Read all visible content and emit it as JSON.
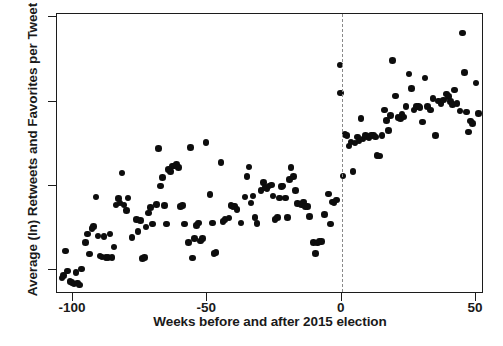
{
  "chart_data": {
    "type": "scatter",
    "title": "",
    "xlabel": "Weeks before and after 2015 election",
    "ylabel": "Average (ln) Retweets and Favorites per Tweet",
    "xlim": [
      -106,
      53
    ],
    "ylim": [
      0.36,
      2.02
    ],
    "xticks": [
      -100,
      -50,
      0,
      50
    ],
    "xtick_labels": [
      "-100",
      "-50",
      "0",
      "50"
    ],
    "yticks": [
      0.5,
      1.0,
      1.5,
      2.0
    ],
    "ytick_labels": [
      ".5",
      "1",
      "1.5",
      "2"
    ],
    "grid": false,
    "legend": null,
    "marker_color": "#0d0d0d",
    "marker_size_px": 6.6,
    "frame_color": "#1c1c1c",
    "annotations": [
      {
        "type": "vline",
        "x": 0,
        "style": "dashed",
        "color": "#8a8a8a",
        "label": "2015 election"
      }
    ],
    "points": [
      [
        -104.2,
        0.455
      ],
      [
        -103.6,
        0.468
      ],
      [
        -102.8,
        0.615
      ],
      [
        -102.0,
        0.497
      ],
      [
        -101.2,
        0.435
      ],
      [
        -100.4,
        0.428
      ],
      [
        -99.6,
        0.419
      ],
      [
        -99.0,
        0.487
      ],
      [
        -98.3,
        0.425
      ],
      [
        -97.6,
        0.413
      ],
      [
        -96.9,
        0.508
      ],
      [
        -95.4,
        0.666
      ],
      [
        -94.6,
        0.716
      ],
      [
        -93.8,
        0.598
      ],
      [
        -93.0,
        0.748
      ],
      [
        -92.3,
        0.76
      ],
      [
        -91.5,
        0.935
      ],
      [
        -90.7,
        0.703
      ],
      [
        -90.0,
        0.585
      ],
      [
        -89.2,
        0.579
      ],
      [
        -88.5,
        0.7
      ],
      [
        -87.8,
        0.578
      ],
      [
        -87.0,
        0.578
      ],
      [
        -86.2,
        0.716
      ],
      [
        -85.5,
        0.575
      ],
      [
        -84.8,
        0.638
      ],
      [
        -84.0,
        0.887
      ],
      [
        -83.2,
        0.925
      ],
      [
        -82.5,
        0.9
      ],
      [
        -81.8,
        1.077
      ],
      [
        -81.0,
        0.888
      ],
      [
        -80.2,
        0.856
      ],
      [
        -79.5,
        0.93
      ],
      [
        -78.0,
        0.695
      ],
      [
        -76.5,
        0.8
      ],
      [
        -75.8,
        0.73
      ],
      [
        -75.0,
        0.795
      ],
      [
        -74.2,
        0.57
      ],
      [
        -73.5,
        0.578
      ],
      [
        -72.8,
        0.757
      ],
      [
        -72.0,
        0.84
      ],
      [
        -71.2,
        0.872
      ],
      [
        -70.5,
        0.775
      ],
      [
        -69.0,
        0.892
      ],
      [
        -68.2,
        1.222
      ],
      [
        -67.5,
        1.0
      ],
      [
        -66.8,
        1.052
      ],
      [
        -66.0,
        0.885
      ],
      [
        -65.2,
        0.775
      ],
      [
        -64.5,
        1.098
      ],
      [
        -63.8,
        1.086
      ],
      [
        -63.0,
        1.118
      ],
      [
        -62.2,
        1.118
      ],
      [
        -61.5,
        1.128
      ],
      [
        -60.8,
        1.11
      ],
      [
        -60.0,
        0.88
      ],
      [
        -59.2,
        0.885
      ],
      [
        -58.5,
        0.775
      ],
      [
        -57.0,
        0.666
      ],
      [
        -56.2,
        1.228
      ],
      [
        -55.5,
        0.573
      ],
      [
        -54.8,
        0.69
      ],
      [
        -54.0,
        0.765
      ],
      [
        -53.2,
        0.78
      ],
      [
        -52.5,
        0.675
      ],
      [
        -51.8,
        0.69
      ],
      [
        -50.5,
        1.258
      ],
      [
        -49.0,
        0.95
      ],
      [
        -48.2,
        0.78
      ],
      [
        -47.5,
        0.6
      ],
      [
        -46.8,
        0.605
      ],
      [
        -45.0,
        1.14
      ],
      [
        -44.2,
        0.79
      ],
      [
        -43.5,
        0.8
      ],
      [
        -42.0,
        0.81
      ],
      [
        -41.2,
        0.885
      ],
      [
        -40.5,
        0.88
      ],
      [
        -39.8,
        0.882
      ],
      [
        -39.0,
        0.86
      ],
      [
        -37.5,
        0.78
      ],
      [
        -36.0,
        0.935
      ],
      [
        -35.2,
        1.055
      ],
      [
        -34.5,
        1.113
      ],
      [
        -33.8,
        0.9
      ],
      [
        -33.0,
        0.94
      ],
      [
        -32.2,
        0.815
      ],
      [
        -31.5,
        0.778
      ],
      [
        -30.0,
        0.975
      ],
      [
        -29.2,
        1.02
      ],
      [
        -28.5,
        0.99
      ],
      [
        -27.8,
        0.985
      ],
      [
        -27.0,
        1.0
      ],
      [
        -26.2,
        1.007
      ],
      [
        -25.5,
        0.94
      ],
      [
        -24.8,
        0.8
      ],
      [
        -24.0,
        0.815
      ],
      [
        -23.2,
        0.93
      ],
      [
        -22.5,
        0.998
      ],
      [
        -21.8,
        1.0
      ],
      [
        -21.0,
        0.93
      ],
      [
        -20.2,
        0.815
      ],
      [
        -19.5,
        1.04
      ],
      [
        -18.8,
        1.11
      ],
      [
        -18.0,
        1.055
      ],
      [
        -17.2,
        0.975
      ],
      [
        -16.5,
        0.898
      ],
      [
        -15.0,
        0.89
      ],
      [
        -14.2,
        0.905
      ],
      [
        -13.5,
        0.88
      ],
      [
        -12.8,
        0.878
      ],
      [
        -12.0,
        0.818
      ],
      [
        -10.5,
        0.665
      ],
      [
        -9.8,
        0.6
      ],
      [
        -9.0,
        0.662
      ],
      [
        -8.2,
        0.67
      ],
      [
        -7.5,
        0.672
      ],
      [
        -6.5,
        0.832
      ],
      [
        -5.0,
        0.952
      ],
      [
        -4.2,
        0.775
      ],
      [
        -3.5,
        0.905
      ],
      [
        -2.8,
        0.9
      ],
      [
        -2.0,
        0.918
      ],
      [
        -0.6,
        1.718
      ],
      [
        -0.5,
        1.552
      ],
      [
        0.5,
        1.06
      ],
      [
        1.2,
        1.305
      ],
      [
        2.0,
        1.3
      ],
      [
        2.8,
        1.238
      ],
      [
        3.5,
        1.262
      ],
      [
        4.2,
        1.088
      ],
      [
        5.0,
        1.255
      ],
      [
        5.8,
        1.29
      ],
      [
        6.5,
        1.268
      ],
      [
        7.2,
        1.4
      ],
      [
        8.0,
        1.28
      ],
      [
        8.8,
        1.3
      ],
      [
        9.5,
        1.295
      ],
      [
        10.2,
        1.285
      ],
      [
        11.0,
        1.302
      ],
      [
        11.8,
        1.3
      ],
      [
        12.5,
        1.29
      ],
      [
        13.2,
        1.18
      ],
      [
        14.0,
        1.178
      ],
      [
        15.0,
        1.3
      ],
      [
        16.0,
        1.45
      ],
      [
        16.8,
        1.39
      ],
      [
        17.5,
        1.33
      ],
      [
        18.2,
        1.42
      ],
      [
        19.0,
        1.745
      ],
      [
        20.0,
        1.535
      ],
      [
        21.0,
        1.408
      ],
      [
        21.8,
        1.4
      ],
      [
        22.5,
        1.425
      ],
      [
        23.2,
        1.41
      ],
      [
        24.0,
        1.47
      ],
      [
        25.0,
        1.665
      ],
      [
        26.0,
        1.58
      ],
      [
        27.0,
        1.45
      ],
      [
        27.8,
        1.472
      ],
      [
        28.5,
        1.47
      ],
      [
        29.2,
        1.465
      ],
      [
        30.0,
        1.38
      ],
      [
        31.0,
        1.64
      ],
      [
        32.0,
        1.47
      ],
      [
        33.0,
        1.45
      ],
      [
        34.0,
        1.52
      ],
      [
        35.0,
        1.3
      ],
      [
        36.0,
        1.505
      ],
      [
        37.0,
        1.49
      ],
      [
        38.0,
        1.51
      ],
      [
        39.0,
        1.545
      ],
      [
        39.8,
        1.53
      ],
      [
        40.5,
        1.5
      ],
      [
        41.2,
        1.485
      ],
      [
        42.0,
        1.57
      ],
      [
        43.0,
        1.49
      ],
      [
        44.0,
        1.445
      ],
      [
        45.0,
        1.908
      ],
      [
        45.8,
        1.672
      ],
      [
        46.5,
        1.44
      ],
      [
        47.2,
        1.32
      ],
      [
        48.0,
        1.385
      ],
      [
        48.8,
        1.37
      ],
      [
        50.0,
        1.612
      ],
      [
        51.0,
        1.43
      ]
    ]
  },
  "figure": {
    "caption_ghost": ""
  }
}
